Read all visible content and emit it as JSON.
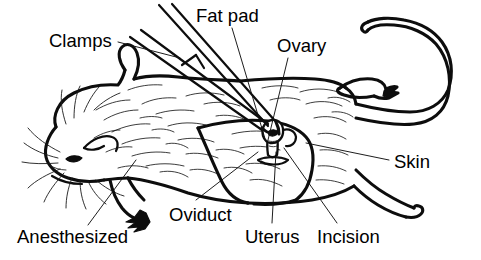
{
  "figure": {
    "style": "black and white line drawing",
    "background_color": "#ffffff",
    "line_color": "#0d0d0d"
  },
  "labels": [
    {
      "id": "clamps",
      "text": "Clamps",
      "x": 49,
      "y": 31,
      "anchor": "start"
    },
    {
      "id": "fat-pad",
      "text": "Fat pad",
      "x": 196,
      "y": 6,
      "anchor": "start"
    },
    {
      "id": "ovary",
      "text": "Ovary",
      "x": 277,
      "y": 36,
      "anchor": "start"
    },
    {
      "id": "skin",
      "text": "Skin",
      "x": 394,
      "y": 152,
      "anchor": "start"
    },
    {
      "id": "anesthesized",
      "text": "Anesthesized",
      "x": 17,
      "y": 227,
      "anchor": "start"
    },
    {
      "id": "oviduct",
      "text": "Oviduct",
      "x": 169,
      "y": 205,
      "anchor": "start"
    },
    {
      "id": "uterus",
      "text": "Uterus",
      "x": 245,
      "y": 227,
      "anchor": "start"
    },
    {
      "id": "incision",
      "text": "Incision",
      "x": 317,
      "y": 227,
      "anchor": "start"
    }
  ],
  "leader_lines": [
    {
      "id": "clamps-leader",
      "from": "Clamps",
      "x1": 118,
      "y1": 42,
      "x2": 180,
      "y2": 58
    },
    {
      "id": "fatpad-leader",
      "from": "Fat pad",
      "x1": 232,
      "y1": 28,
      "x2": 266,
      "y2": 142
    },
    {
      "id": "ovary-leader",
      "from": "Ovary",
      "x1": 288,
      "y1": 58,
      "x2": 268,
      "y2": 140
    },
    {
      "id": "skin-leader",
      "from": "Skin",
      "x1": 389,
      "y1": 160,
      "x2": 306,
      "y2": 143
    },
    {
      "id": "anesth-leader",
      "from": "Anesthesized",
      "x1": 88,
      "y1": 225,
      "x2": 136,
      "y2": 160
    },
    {
      "id": "oviduct-leader",
      "from": "Oviduct",
      "x1": 196,
      "y1": 200,
      "x2": 258,
      "y2": 152
    },
    {
      "id": "uterus-leader",
      "from": "Uterus",
      "x1": 272,
      "y1": 223,
      "x2": 276,
      "y2": 152
    },
    {
      "id": "incision-leader",
      "from": "Incision",
      "x1": 337,
      "y1": 223,
      "x2": 284,
      "y2": 148
    }
  ],
  "anatomy_parts": [
    {
      "id": "head",
      "name": "mouse-head"
    },
    {
      "id": "ear",
      "name": "mouse-ear"
    },
    {
      "id": "eye",
      "name": "closed-eye"
    },
    {
      "id": "nose",
      "name": "mouse-nose"
    },
    {
      "id": "whiskers",
      "name": "whiskers"
    },
    {
      "id": "body",
      "name": "mouse-body"
    },
    {
      "id": "foreleg",
      "name": "front-leg-and-paw"
    },
    {
      "id": "hindleg",
      "name": "hind-leg-and-foot"
    },
    {
      "id": "rear-foot",
      "name": "rear-foot"
    },
    {
      "id": "tail",
      "name": "mouse-tail"
    },
    {
      "id": "fur",
      "name": "fur-texture-strokes"
    },
    {
      "id": "skin-flap",
      "name": "retracted-skin-flap"
    },
    {
      "id": "incision",
      "name": "incision-slit"
    },
    {
      "id": "ovary-tissue",
      "name": "exposed-ovary-tissue"
    },
    {
      "id": "forceps",
      "name": "surgical-forceps-clamps"
    }
  ]
}
